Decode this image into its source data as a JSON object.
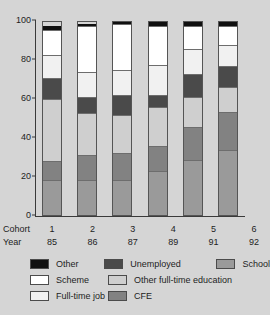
{
  "chart_data": {
    "type": "bar",
    "subtype": "stacked-bar-100",
    "title": "",
    "xlabel": "",
    "ylabel": "",
    "ylim": [
      0,
      100
    ],
    "yticks": [
      0,
      20,
      40,
      60,
      80,
      100
    ],
    "grid": false,
    "legend_position": "bottom",
    "categories": [
      "1",
      "2",
      "3",
      "4",
      "5",
      "6"
    ],
    "category_axis_rows": [
      {
        "name": "Cohort",
        "values": [
          "1",
          "2",
          "3",
          "4",
          "5",
          "6"
        ]
      },
      {
        "name": "Year",
        "values": [
          "85",
          "86",
          "87",
          "89",
          "91",
          "92"
        ]
      }
    ],
    "stack_order_bottom_to_top": [
      "School",
      "CFE",
      "Other full-time education",
      "Unemployed",
      "Full-time job",
      "Scheme",
      "Other"
    ],
    "series": [
      {
        "name": "School",
        "color": "#9a9a9a",
        "values": [
          18,
          18,
          18,
          23,
          29,
          34
        ]
      },
      {
        "name": "CFE",
        "color": "#828282",
        "values": [
          10,
          13,
          14,
          13,
          17,
          20
        ]
      },
      {
        "name": "Other full-time education",
        "color": "#cfcfcf",
        "values": [
          32,
          22,
          20,
          20,
          16,
          13
        ]
      },
      {
        "name": "Unemployed",
        "color": "#4a4a4a",
        "values": [
          11,
          8,
          10,
          6,
          12,
          11
        ]
      },
      {
        "name": "Full-time job",
        "color": "#f1f1f1",
        "values": [
          12,
          13,
          13,
          16,
          13,
          11
        ]
      },
      {
        "name": "Scheme",
        "color": "#ffffff",
        "values": [
          13,
          24,
          24,
          20,
          12,
          10
        ]
      },
      {
        "name": "Other",
        "color": "#101010",
        "values": [
          2,
          1,
          1,
          2,
          2,
          2
        ]
      }
    ]
  },
  "legend": {
    "rows": [
      [
        {
          "label": "Other",
          "color": "#101010"
        },
        {
          "label": "Unemployed",
          "color": "#4a4a4a"
        },
        {
          "label": "School",
          "color": "#9a9a9a"
        }
      ],
      [
        {
          "label": "Scheme",
          "color": "#ffffff"
        },
        {
          "label": "Other full-time education",
          "color": "#cfcfcf"
        }
      ],
      [
        {
          "label": "Full-time job",
          "color": "#f1f1f1"
        },
        {
          "label": "CFE",
          "color": "#828282"
        }
      ]
    ]
  },
  "colors": {
    "background": "#d5d5d5",
    "axis": "#3a3a3a",
    "text": "#1d1d1d"
  }
}
